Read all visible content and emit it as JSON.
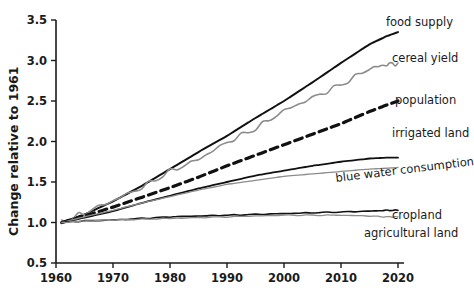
{
  "chart_data": {
    "type": "line",
    "title": "",
    "xlabel": "",
    "ylabel": "Change relative to 1961",
    "xlim": [
      1960,
      2020
    ],
    "ylim": [
      0.5,
      3.5
    ],
    "grid": false,
    "legend_position": "right-inline-labels",
    "x_ticks": [
      "1960",
      "1970",
      "1980",
      "1990",
      "2000",
      "2010",
      "2020"
    ],
    "y_ticks": [
      "0.5",
      "1.0",
      "1.5",
      "2.0",
      "2.5",
      "3.0",
      "3.5"
    ],
    "x": [
      1961,
      1965,
      1970,
      1975,
      1980,
      1985,
      1990,
      1995,
      2000,
      2005,
      2010,
      2015,
      2018,
      2020
    ],
    "series": [
      {
        "name": "food supply",
        "label": "food supply",
        "color": "#111111",
        "style": "solid",
        "width": 2.0,
        "values": [
          1.0,
          1.1,
          1.26,
          1.45,
          1.66,
          1.87,
          2.07,
          2.29,
          2.5,
          2.73,
          2.97,
          3.2,
          3.3,
          3.35
        ]
      },
      {
        "name": "cereal yield",
        "label": "cereal yield",
        "color": "#8c8c8c",
        "style": "solid",
        "width": 1.6,
        "values": [
          1.0,
          1.12,
          1.27,
          1.43,
          1.63,
          1.78,
          1.99,
          2.16,
          2.38,
          2.54,
          2.7,
          2.9,
          2.95,
          2.97
        ]
      },
      {
        "name": "population",
        "label": "population",
        "color": "#111111",
        "style": "dashed",
        "width": 3.2,
        "values": [
          1.0,
          1.08,
          1.19,
          1.31,
          1.43,
          1.56,
          1.7,
          1.83,
          1.96,
          2.09,
          2.22,
          2.37,
          2.45,
          2.5
        ]
      },
      {
        "name": "irrigated land",
        "label": "irrigated land",
        "color": "#111111",
        "style": "solid",
        "width": 1.8,
        "values": [
          1.0,
          1.06,
          1.14,
          1.24,
          1.33,
          1.42,
          1.5,
          1.58,
          1.64,
          1.7,
          1.75,
          1.79,
          1.8,
          1.8
        ]
      },
      {
        "name": "blue water consumption",
        "label": "blue water consumption",
        "color": "#8c8c8c",
        "style": "solid",
        "width": 1.3,
        "values": [
          1.0,
          1.07,
          1.15,
          1.24,
          1.32,
          1.4,
          1.47,
          1.52,
          1.57,
          1.6,
          1.63,
          1.66,
          1.67,
          1.68
        ]
      },
      {
        "name": "cropland",
        "label": "cropland",
        "color": "#111111",
        "style": "solid",
        "width": 1.6,
        "values": [
          1.0,
          1.02,
          1.03,
          1.05,
          1.07,
          1.08,
          1.09,
          1.1,
          1.11,
          1.12,
          1.13,
          1.14,
          1.15,
          1.15
        ]
      },
      {
        "name": "agricultural land",
        "label": "agricultural land",
        "color": "#8c8c8c",
        "style": "solid",
        "width": 1.3,
        "values": [
          1.0,
          1.02,
          1.03,
          1.04,
          1.05,
          1.06,
          1.07,
          1.08,
          1.09,
          1.09,
          1.09,
          1.08,
          1.07,
          1.07
        ]
      }
    ],
    "annotations": [
      {
        "name": "food-supply-label",
        "text": "food supply",
        "x": 2018,
        "y": 3.47,
        "rotation": 0
      },
      {
        "name": "cereal-yield-label",
        "text": "cereal yield",
        "x": 2019,
        "y": 3.05,
        "rotation": 0
      },
      {
        "name": "population-label",
        "text": "population",
        "x": 2020,
        "y": 2.57,
        "rotation": 0
      },
      {
        "name": "irrigated-land-label",
        "text": "irrigated land",
        "x": 2020,
        "y": 2.17,
        "rotation": 0
      },
      {
        "name": "blue-water-consumption-label",
        "text": "blue water consumption",
        "x": 2007,
        "y": 1.68,
        "rotation": -7
      },
      {
        "name": "cropland-label",
        "text": "cropland",
        "x": 2020,
        "y": 1.18,
        "rotation": 0
      },
      {
        "name": "agricultural-land-label",
        "text": "agricultural land",
        "x": 2013,
        "y": 1.0,
        "rotation": 0
      }
    ]
  }
}
